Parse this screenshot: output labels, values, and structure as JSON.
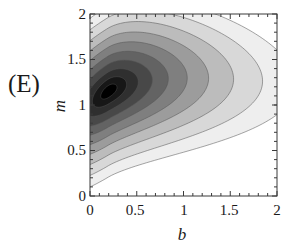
{
  "panel": {
    "label": "(E)"
  },
  "chart_data": {
    "type": "contour",
    "title": "",
    "subtitle": "",
    "xlabel": "b",
    "ylabel": "m",
    "xlim": [
      0,
      2
    ],
    "ylim": [
      0,
      2
    ],
    "xticks": [
      0,
      0.5,
      1,
      1.5,
      2
    ],
    "yticks": [
      0,
      0.5,
      1,
      1.5,
      2
    ],
    "xtick_labels": [
      "0",
      "0.5",
      "1",
      "1.5",
      "2"
    ],
    "ytick_labels": [
      "0",
      "0.5",
      "1",
      "1.5",
      "2"
    ],
    "grid": false,
    "legend": "none",
    "frame": true,
    "colormap": "grayscale_dark_to_light",
    "peak": {
      "b": 0.2,
      "m": 1.15
    },
    "n_levels": 10,
    "level_fills": [
      "#000000",
      "#171717",
      "#2f2f2f",
      "#484848",
      "#636363",
      "#7f7f7f",
      "#9c9c9c",
      "#bcbcbc",
      "#d8d8d8",
      "#eeeeee",
      "#ffffff"
    ],
    "contour_line_color": "#555555",
    "bands": [
      {
        "level": 10,
        "scale": 0.085,
        "fill": "#000000"
      },
      {
        "level": 9,
        "scale": 0.175,
        "fill": "#171717"
      },
      {
        "level": 8,
        "scale": 0.275,
        "fill": "#2f2f2f"
      },
      {
        "level": 7,
        "scale": 0.385,
        "fill": "#484848"
      },
      {
        "level": 6,
        "scale": 0.5,
        "fill": "#636363"
      },
      {
        "level": 5,
        "scale": 0.625,
        "fill": "#7f7f7f"
      },
      {
        "level": 4,
        "scale": 0.755,
        "fill": "#9c9c9c"
      },
      {
        "level": 3,
        "scale": 0.895,
        "fill": "#bcbcbc"
      },
      {
        "level": 2,
        "scale": 1.045,
        "fill": "#d8d8d8"
      },
      {
        "level": 1,
        "scale": 1.205,
        "fill": "#eeeeee"
      }
    ]
  },
  "axes": {
    "x_tick_labels": [
      "0",
      "0.5",
      "1",
      "1.5",
      "2"
    ],
    "y_tick_labels": [
      "0",
      "0.5",
      "1",
      "1.5",
      "2"
    ]
  }
}
